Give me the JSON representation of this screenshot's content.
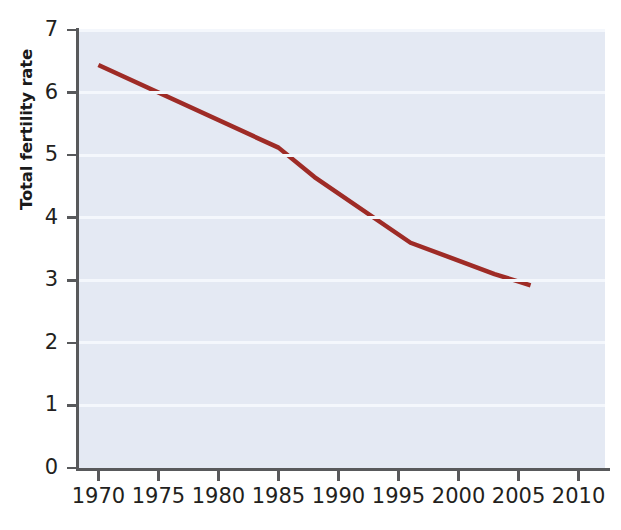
{
  "chart_data": {
    "type": "line",
    "title": "",
    "xlabel": "",
    "ylabel": "Total fertility rate",
    "xlim": [
      1968.3,
      2012.2
    ],
    "ylim": [
      0,
      7
    ],
    "grid": true,
    "legend": "none",
    "xticks": [
      1970,
      1975,
      1980,
      1985,
      1990,
      1995,
      2000,
      2005,
      2010
    ],
    "xticklabels": [
      "1970",
      "1975",
      "1980",
      "1985",
      "1990",
      "1995",
      "2000",
      "2005",
      "2010"
    ],
    "yticks": [
      0,
      1,
      2,
      3,
      4,
      5,
      6,
      7
    ],
    "yticklabels": [
      "0",
      "1",
      "2",
      "3",
      "4",
      "5",
      "6",
      "7"
    ],
    "series": [
      {
        "name": "Total fertility rate",
        "color": "#9e2b26",
        "linewidth": 4.5,
        "x": [
          1970,
          1985,
          1988,
          1996,
          2003,
          2006
        ],
        "values": [
          6.44,
          5.12,
          4.65,
          3.6,
          3.1,
          2.92
        ]
      }
    ],
    "colors": {
      "line": "#9e2b26",
      "plot_background": "#e4e9f3",
      "gridline": "#f4f7fc",
      "axis": "#58595b",
      "tick_text": "#231f20",
      "axis_title": "#1a1a1a",
      "figure_background": "#ffffff"
    }
  }
}
